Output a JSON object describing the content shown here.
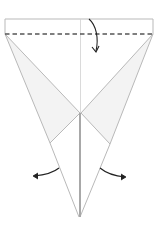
{
  "diagram": {
    "type": "origami-step",
    "colors": {
      "background": "#ffffff",
      "paper": "#ffffff",
      "flap_fill": "#f3f3f3",
      "edge": "#b9b9b9",
      "center_crease": "#c8c8c8",
      "center_thick": "#a8a8a8",
      "fold_line": "#555555",
      "arrow": "#222222"
    },
    "instructions": {
      "fold_top": "Fold the top edge down along the dashed line",
      "unfold_left": "Open left flap outward",
      "unfold_right": "Open right flap outward"
    }
  }
}
